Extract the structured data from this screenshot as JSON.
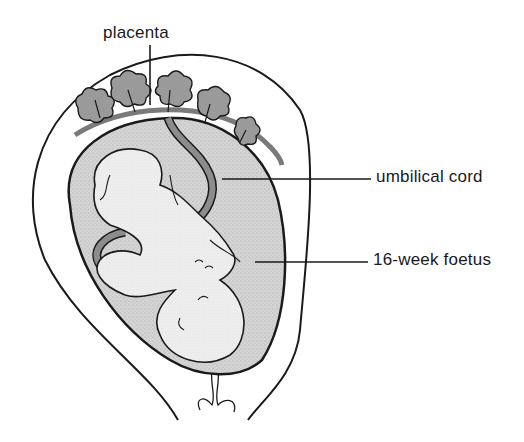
{
  "diagram": {
    "type": "anatomical-illustration",
    "labels": [
      {
        "id": "placenta",
        "text": "placenta"
      },
      {
        "id": "umbilical_cord",
        "text": "umbilical cord"
      },
      {
        "id": "foetus",
        "text": "16-week foetus"
      }
    ],
    "colors": {
      "background": "#ffffff",
      "outline": "#1a1a1a",
      "amniotic_fluid": "#cfcfcf",
      "foetus_fill": "#ececec",
      "cord_fill": "#8c8c8c",
      "placenta_fill": "#9a9a9a"
    }
  }
}
